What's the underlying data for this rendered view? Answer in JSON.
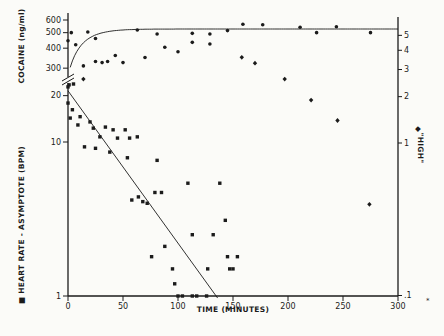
{
  "figure": {
    "background": "#fbfbf8",
    "ink": "#1b1b1b"
  },
  "axes": {
    "x": {
      "label": "TIME (MINUTES)",
      "min": 0,
      "max": 300,
      "ticks": [
        [
          0,
          "0"
        ],
        [
          50,
          "50"
        ],
        [
          100,
          "100"
        ],
        [
          150,
          "150"
        ],
        [
          200,
          "200"
        ],
        [
          250,
          "250"
        ],
        [
          300,
          "300"
        ]
      ]
    },
    "left_upper": {
      "label": "COCAINE (ng/ml)",
      "scale": "log",
      "ticks": [
        [
          600,
          "600"
        ],
        [
          500,
          "500"
        ],
        [
          400,
          "400"
        ],
        [
          300,
          "300"
        ]
      ]
    },
    "left_lower": {
      "label": "■ HEART RATE - ASYMPTOTE (BPM)",
      "scale": "log",
      "ticks": [
        [
          20,
          "20"
        ],
        [
          10,
          "10"
        ],
        [
          1,
          "1"
        ]
      ]
    },
    "right": {
      "label": "\"HIGH\"",
      "marker": "◆",
      "scale": "log",
      "ticks": [
        [
          5,
          "5"
        ],
        [
          4,
          "4"
        ],
        [
          3,
          "3"
        ],
        [
          2,
          "2"
        ],
        [
          1,
          "1"
        ],
        [
          0.1,
          ".1"
        ]
      ]
    },
    "axis_break": "left axis broken between ~25 BPM and 300 ng/ml"
  },
  "chart_data": {
    "type": "scatter",
    "title": "",
    "xlabel": "TIME (MINUTES)",
    "xlim": [
      0,
      300
    ],
    "grid": false,
    "footnote_mark": "*",
    "series": [
      {
        "name": "cocaine_ng_ml",
        "symbol": "circle",
        "axis": "left_upper",
        "points": [
          [
            3,
            500
          ],
          [
            7,
            420
          ],
          [
            14,
            310
          ],
          [
            18,
            505
          ],
          [
            25,
            460
          ],
          [
            25,
            330
          ],
          [
            31,
            325
          ],
          [
            36,
            330
          ],
          [
            43,
            360
          ],
          [
            50,
            325
          ],
          [
            63,
            520
          ],
          [
            70,
            350
          ],
          [
            81,
            490
          ],
          [
            88,
            405
          ],
          [
            100,
            380
          ],
          [
            113,
            495
          ],
          [
            113,
            435
          ],
          [
            129,
            490
          ],
          [
            129,
            425
          ],
          [
            145,
            515
          ],
          [
            159,
            565
          ],
          [
            177,
            560
          ],
          [
            211,
            540
          ],
          [
            226,
            500
          ],
          [
            244,
            545
          ],
          [
            275,
            500
          ],
          [
            0,
            445
          ]
        ]
      },
      {
        "name": "heart_rate_minus_asymptote_bpm",
        "symbol": "square",
        "axis": "left_lower",
        "points": [
          [
            0,
            22.8
          ],
          [
            1,
            23.5
          ],
          [
            5,
            23.8
          ],
          [
            0,
            17.9
          ],
          [
            4,
            16.2
          ],
          [
            2,
            14.3
          ],
          [
            11,
            14.6
          ],
          [
            9,
            12.9
          ],
          [
            15,
            9.3
          ],
          [
            20,
            13.5
          ],
          [
            23,
            12.3
          ],
          [
            25,
            9.1
          ],
          [
            29,
            10.8
          ],
          [
            34,
            12.5
          ],
          [
            38,
            8.6
          ],
          [
            41,
            12.0
          ],
          [
            45,
            10.6
          ],
          [
            52,
            12.0
          ],
          [
            56,
            10.6
          ],
          [
            63,
            10.8
          ],
          [
            54,
            7.9
          ],
          [
            58,
            4.2
          ],
          [
            64,
            4.4
          ],
          [
            68,
            4.1
          ],
          [
            72,
            4.0
          ],
          [
            79,
            4.7
          ],
          [
            85,
            4.7
          ],
          [
            81,
            7.6
          ],
          [
            76,
            1.8
          ],
          [
            88,
            2.1
          ],
          [
            95,
            1.5
          ],
          [
            97,
            1.2
          ],
          [
            100,
            1.0
          ],
          [
            104,
            1.0
          ],
          [
            109,
            5.4
          ],
          [
            113,
            2.5
          ],
          [
            113,
            1.0
          ],
          [
            117,
            1.0
          ],
          [
            126,
            1.0
          ],
          [
            127,
            1.5
          ],
          [
            132,
            2.5
          ],
          [
            138,
            5.4
          ],
          [
            143,
            3.1
          ],
          [
            145,
            1.8
          ],
          [
            147,
            1.5
          ],
          [
            150,
            1.5
          ],
          [
            154,
            1.8
          ]
        ]
      },
      {
        "name": "high_rating",
        "symbol": "diamond",
        "axis": "right",
        "points": [
          [
            14,
            2.6
          ],
          [
            158,
            3.6
          ],
          [
            170,
            3.3
          ],
          [
            197,
            2.6
          ],
          [
            221,
            1.9
          ],
          [
            245,
            1.4
          ],
          [
            274,
            0.4
          ]
        ]
      }
    ],
    "fits": [
      {
        "name": "cocaine_fit",
        "type": "exponential_rise_to_asymptote",
        "asymptote": 527,
        "tau_min": 14,
        "t_shift_min": 10
      },
      {
        "name": "heart_rate_fit",
        "type": "exponential_decay_line",
        "points": [
          [
            0,
            21.5
          ],
          [
            136,
            0.97
          ]
        ]
      }
    ]
  }
}
